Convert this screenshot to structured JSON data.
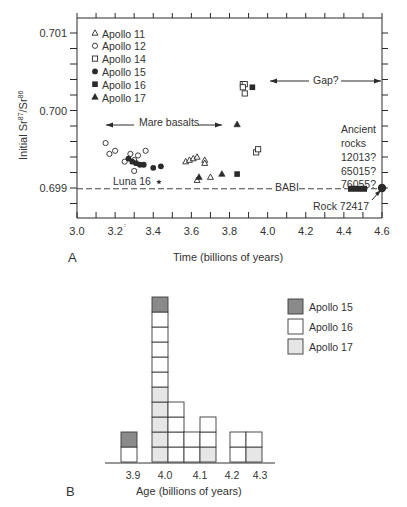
{
  "figure": {
    "panel_a_label": "A",
    "panel_b_label": "B"
  },
  "chart_data": [
    {
      "type": "scatter",
      "title": "",
      "xlabel": "Time (billions of years)",
      "ylabel": "Initial Sr87/Sr86",
      "ylabel_main": "Initial Sr",
      "ylabel_sup1": "87",
      "ylabel_mid": "/Sr",
      "ylabel_sup2": "86",
      "xlim": [
        3.0,
        4.6
      ],
      "ylim": [
        0.6986,
        0.7012
      ],
      "xticks": [
        "3.0",
        "3.2",
        "3.4",
        "3.6",
        "3.8",
        "4.0",
        "4.2",
        "4.4",
        "4.6"
      ],
      "yticks": [
        "0.699",
        "0.700",
        "0.701"
      ],
      "legend": [
        {
          "label": "Apollo 11",
          "marker": "open-triangle"
        },
        {
          "label": "Apollo 12",
          "marker": "open-circle"
        },
        {
          "label": "Apollo 14",
          "marker": "open-square"
        },
        {
          "label": "Apollo 15",
          "marker": "filled-circle"
        },
        {
          "label": "Apollo 16",
          "marker": "filled-square"
        },
        {
          "label": "Apollo 17",
          "marker": "filled-triangle"
        }
      ],
      "series": [
        {
          "name": "Apollo 11",
          "points": [
            [
              3.57,
              0.69934
            ],
            [
              3.59,
              0.69936
            ],
            [
              3.61,
              0.69938
            ],
            [
              3.63,
              0.6994
            ],
            [
              3.67,
              0.69936
            ],
            [
              3.67,
              0.69932
            ],
            [
              3.7,
              0.69914
            ],
            [
              3.63,
              0.6991
            ]
          ]
        },
        {
          "name": "Apollo 12",
          "points": [
            [
              3.15,
              0.69958
            ],
            [
              3.17,
              0.69944
            ],
            [
              3.2,
              0.69948
            ],
            [
              3.25,
              0.69934
            ],
            [
              3.28,
              0.69944
            ],
            [
              3.3,
              0.69936
            ],
            [
              3.32,
              0.69942
            ],
            [
              3.36,
              0.69948
            ],
            [
              3.3,
              0.69922
            ]
          ]
        },
        {
          "name": "Apollo 14",
          "points": [
            [
              3.87,
              0.70034
            ],
            [
              3.88,
              0.70034
            ],
            [
              3.87,
              0.7003
            ],
            [
              3.88,
              0.70022
            ],
            [
              3.94,
              0.69946
            ],
            [
              3.95,
              0.6995
            ]
          ]
        },
        {
          "name": "Apollo 15",
          "points": [
            [
              3.27,
              0.69938
            ],
            [
              3.29,
              0.69934
            ],
            [
              3.31,
              0.69932
            ],
            [
              3.33,
              0.6993
            ],
            [
              3.35,
              0.6993
            ],
            [
              3.4,
              0.69926
            ],
            [
              3.44,
              0.69928
            ]
          ]
        },
        {
          "name": "Apollo 16",
          "points": [
            [
              3.92,
              0.7003
            ],
            [
              3.84,
              0.69918
            ]
          ]
        },
        {
          "name": "Apollo 17",
          "points": [
            [
              3.84,
              0.69982
            ],
            [
              3.64,
              0.69914
            ],
            [
              3.76,
              0.69918
            ]
          ]
        },
        {
          "name": "Rock 72417",
          "points": [
            [
              4.6,
              0.699
            ]
          ]
        }
      ],
      "annotations": [
        {
          "text": "Mare basalts",
          "type": "double-arrow",
          "x_range": [
            3.15,
            3.77
          ],
          "y": 0.6998
        },
        {
          "text": "Gap?",
          "type": "double-arrow",
          "x_range": [
            3.97,
            4.6
          ],
          "y": 0.7003
        },
        {
          "text": "Luna 16",
          "marker": "star",
          "x": 3.43,
          "y": 0.6991
        },
        {
          "text": "BABI",
          "type": "dashed-line",
          "y": 0.69899
        },
        {
          "text": "Ancient rocks 12013? 65015? 76055?",
          "type": "bar",
          "x_range": [
            4.42,
            4.52
          ],
          "y": 0.699
        },
        {
          "text": "Rock 72417",
          "type": "arrow",
          "x": 4.6,
          "y": 0.699
        }
      ]
    },
    {
      "type": "bar",
      "subtype": "stacked-histogram",
      "xlabel": "Age (billions of years)",
      "ylabel": "",
      "categories": [
        "3.9",
        "4.0",
        "4.1",
        "4.2",
        "4.3"
      ],
      "series": [
        {
          "name": "Apollo 15",
          "color": "#8a8a8a",
          "values": [
            1,
            1,
            0,
            0,
            0
          ]
        },
        {
          "name": "Apollo 16",
          "color": "#ffffff",
          "values": [
            1,
            9,
            4,
            3,
            3
          ]
        },
        {
          "name": "Apollo 17",
          "color": "#e6e6e6",
          "values": [
            0,
            5,
            1,
            0,
            1
          ]
        }
      ],
      "legend": [
        "Apollo 15",
        "Apollo 16",
        "Apollo 17"
      ]
    }
  ],
  "annotations_text": {
    "mare": "Mare basalts",
    "gap": "Gap?",
    "luna": "Luna 16",
    "babi": "BABI",
    "ancient1": "Ancient",
    "ancient2": "rocks",
    "ancient3": "12013?",
    "ancient4": "65015?",
    "ancient5": "76055?",
    "rock": "Rock 72417"
  }
}
